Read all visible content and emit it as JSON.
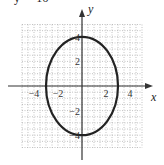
{
  "title_fragment": "y² = 16",
  "chart_data": {
    "type": "line",
    "title": "",
    "equation": "x^2/9 + y^2/16 = 1",
    "xlabel": "x",
    "ylabel": "y",
    "xlim": [
      -5,
      5
    ],
    "ylim": [
      -5,
      5
    ],
    "grid": true,
    "x_ticks": [
      {
        "value": -4,
        "label": "−4"
      },
      {
        "value": -2,
        "label": "−2"
      },
      {
        "value": 2,
        "label": "2"
      },
      {
        "value": 4,
        "label": "4"
      }
    ],
    "y_ticks": [
      {
        "value": 4,
        "label": "4"
      },
      {
        "value": 2,
        "label": "2"
      },
      {
        "value": -2,
        "label": "−2"
      },
      {
        "value": -4,
        "label": "−4"
      }
    ],
    "series": [
      {
        "name": "ellipse",
        "center": [
          0,
          0
        ],
        "semi_axis_x": 3,
        "semi_axis_y": 4,
        "color": "#222222"
      }
    ],
    "legend": null
  },
  "colors": {
    "curve": "#222222",
    "axis": "#333333",
    "grid": "#9a9a9a"
  }
}
